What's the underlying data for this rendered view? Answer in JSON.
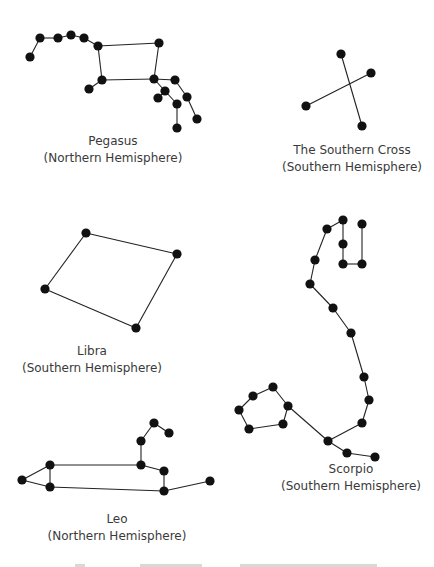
{
  "colors": {
    "star": "#111111",
    "line": "#222222",
    "text": "#3a3a3a",
    "background": "#ffffff"
  },
  "constellations": [
    {
      "name": "Pegasus",
      "hemisphere": "(Northern Hemisphere)",
      "label_pos": [
        113,
        133
      ],
      "stars": [
        [
          30,
          57
        ],
        [
          40,
          38
        ],
        [
          58,
          38
        ],
        [
          71,
          35
        ],
        [
          84,
          38
        ],
        [
          98,
          46
        ],
        [
          159,
          43
        ],
        [
          102,
          80
        ],
        [
          89,
          89
        ],
        [
          154,
          79
        ],
        [
          175,
          80
        ],
        [
          165,
          91
        ],
        [
          158,
          98
        ],
        [
          177,
          104
        ],
        [
          187,
          97
        ],
        [
          197,
          119
        ],
        [
          177,
          128
        ]
      ],
      "edges": [
        [
          0,
          1
        ],
        [
          1,
          2
        ],
        [
          2,
          3
        ],
        [
          3,
          4
        ],
        [
          4,
          5
        ],
        [
          5,
          6
        ],
        [
          6,
          9
        ],
        [
          5,
          7
        ],
        [
          7,
          9
        ],
        [
          7,
          8
        ],
        [
          9,
          10
        ],
        [
          9,
          11
        ],
        [
          11,
          13
        ],
        [
          13,
          16
        ],
        [
          10,
          14
        ],
        [
          14,
          15
        ],
        [
          11,
          12
        ]
      ]
    },
    {
      "name": "The Southern Cross",
      "hemisphere": "(Southern Hemisphere)",
      "label_pos": [
        352,
        142
      ],
      "stars": [
        [
          341,
          54
        ],
        [
          371,
          73
        ],
        [
          306,
          106
        ],
        [
          362,
          126
        ]
      ],
      "edges": [
        [
          0,
          3
        ],
        [
          1,
          2
        ]
      ]
    },
    {
      "name": "Libra",
      "hemisphere": "(Southern Hemisphere)",
      "label_pos": [
        92,
        343
      ],
      "stars": [
        [
          86,
          233
        ],
        [
          177,
          254
        ],
        [
          45,
          289
        ],
        [
          136,
          328
        ]
      ],
      "edges": [
        [
          0,
          1
        ],
        [
          1,
          3
        ],
        [
          3,
          2
        ],
        [
          2,
          0
        ]
      ]
    },
    {
      "name": "Scorpio",
      "hemisphere": "(Southern Hemisphere)",
      "label_pos": [
        351,
        461
      ],
      "stars": [
        [
          343,
          220
        ],
        [
          362,
          224
        ],
        [
          327,
          229
        ],
        [
          343,
          244
        ],
        [
          315,
          260
        ],
        [
          343,
          264
        ],
        [
          362,
          264
        ],
        [
          310,
          284
        ],
        [
          333,
          308
        ],
        [
          351,
          333
        ],
        [
          364,
          377
        ],
        [
          369,
          400
        ],
        [
          362,
          423
        ],
        [
          328,
          441
        ],
        [
          347,
          453
        ],
        [
          375,
          457
        ],
        [
          288,
          406
        ],
        [
          273,
          387
        ],
        [
          253,
          396
        ],
        [
          239,
          410
        ],
        [
          249,
          429
        ],
        [
          283,
          424
        ]
      ],
      "edges": [
        [
          2,
          0
        ],
        [
          0,
          3
        ],
        [
          3,
          5
        ],
        [
          5,
          6
        ],
        [
          6,
          1
        ],
        [
          2,
          4
        ],
        [
          4,
          7
        ],
        [
          7,
          8
        ],
        [
          8,
          9
        ],
        [
          9,
          10
        ],
        [
          10,
          11
        ],
        [
          11,
          12
        ],
        [
          12,
          13
        ],
        [
          13,
          14
        ],
        [
          14,
          15
        ],
        [
          13,
          16
        ],
        [
          16,
          17
        ],
        [
          17,
          18
        ],
        [
          18,
          19
        ],
        [
          19,
          20
        ],
        [
          20,
          21
        ],
        [
          21,
          16
        ]
      ]
    },
    {
      "name": "Leo",
      "hemisphere": "(Northern Hemisphere)",
      "label_pos": [
        117,
        511
      ],
      "stars": [
        [
          22,
          480
        ],
        [
          50,
          465
        ],
        [
          50,
          487
        ],
        [
          141,
          465
        ],
        [
          141,
          441
        ],
        [
          154,
          423
        ],
        [
          169,
          433
        ],
        [
          164,
          471
        ],
        [
          164,
          491
        ],
        [
          210,
          481
        ]
      ],
      "edges": [
        [
          0,
          1
        ],
        [
          0,
          2
        ],
        [
          1,
          2
        ],
        [
          1,
          3
        ],
        [
          3,
          4
        ],
        [
          4,
          5
        ],
        [
          5,
          6
        ],
        [
          3,
          7
        ],
        [
          7,
          8
        ],
        [
          2,
          8
        ],
        [
          8,
          9
        ]
      ]
    }
  ],
  "footer": {
    "cut_off_text_marks": [
      [
        75,
        10
      ],
      [
        140,
        55
      ],
      [
        180,
        22
      ],
      [
        240,
        110
      ],
      [
        322,
        55
      ]
    ]
  }
}
